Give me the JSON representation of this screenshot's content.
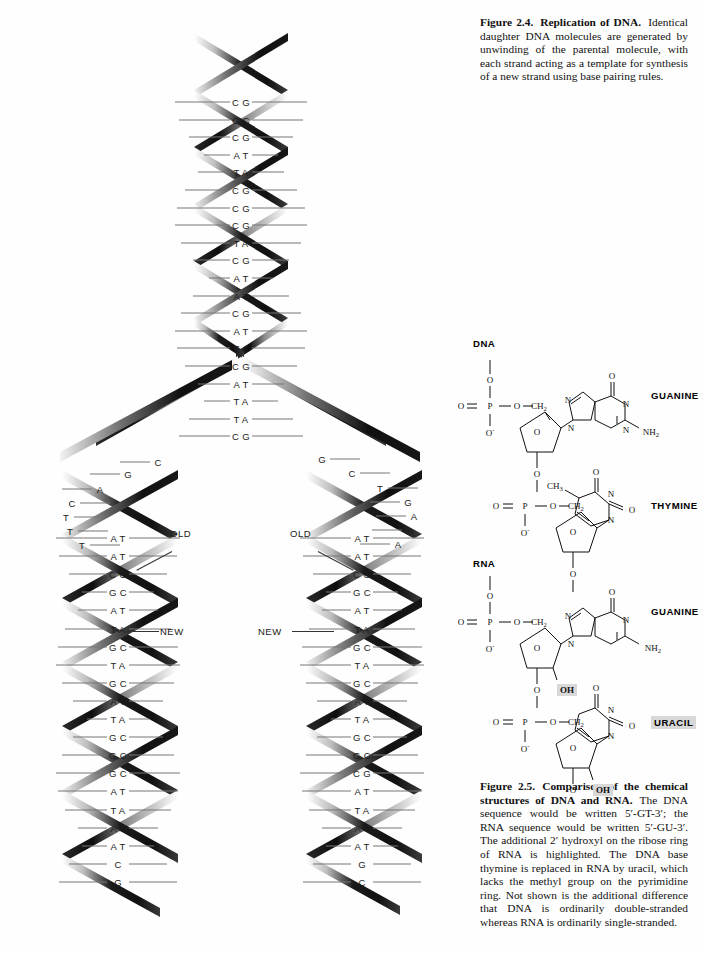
{
  "page": {
    "background": "#ffffff",
    "width": 702,
    "height": 953
  },
  "figure_2_4": {
    "label": "Figure 2.4.",
    "title": "Replication of DNA.",
    "body": "Identical daughter DNA molecules are generated by unwinding of the parental molecule, with each strand acting as a template for synthesis of a new strand using base pairing rules.",
    "annotations": {
      "old_left": "OLD",
      "new_left": "NEW",
      "old_right": "OLD",
      "new_right": "NEW"
    },
    "parent_helix_pairs": [
      "CG",
      "GC",
      "CG",
      "AT",
      "TA",
      "CG",
      "CG",
      "CG",
      "TA",
      "CG",
      "AT",
      "AT",
      "CG",
      "AT",
      "TA",
      "CG",
      "AT",
      "TA",
      "TA",
      "CG"
    ],
    "fork_left_single_bases": [
      "C",
      "G",
      "A",
      "C",
      "T",
      "T",
      "T"
    ],
    "fork_right_single_bases": [
      "G",
      "C",
      "T",
      "G",
      "A",
      "A",
      "A"
    ],
    "daughter_left_pairs": [
      "AT",
      "AT",
      "CG",
      "GC",
      "AT",
      "TA",
      "GC",
      "TA",
      "GC",
      "AT",
      "TA",
      "GC",
      "GC",
      "GC",
      "AT",
      "TA",
      "AT",
      "AT",
      "C",
      "G"
    ],
    "daughter_right_pairs": [
      "AT",
      "AT",
      "CG",
      "GC",
      "AT",
      "TA",
      "GC",
      "TA",
      "GC",
      "AT",
      "TA",
      "GC",
      "GC",
      "CG",
      "AT",
      "TA",
      "AT",
      "AT",
      "G",
      "C"
    ]
  },
  "figure_2_5": {
    "label": "Figure 2.5.",
    "title": "Comparison of the chemical structures of DNA and RNA.",
    "body": "The DNA sequence would be written 5′-GT-3′; the RNA sequence would be written 5′-GU-3′. The additional 2′ hydroxyl on the ribose ring of RNA is highlighted. The DNA base thymine is replaced in RNA by uracil, which lacks the methyl group on the pyrimidine ring. Not shown is the additional difference that DNA is ordinarily double-stranded whereas RNA is ordinarily single-stranded.",
    "dna": {
      "heading": "DNA",
      "base_1": "GUANINE",
      "base_2": "THYMINE",
      "atoms": [
        "O",
        "O",
        "P",
        "O",
        "O",
        "CH2",
        "O",
        "N",
        "N",
        "N",
        "N",
        "NH2",
        "O",
        "O",
        "P",
        "O",
        "O",
        "CH2",
        "O",
        "N",
        "N",
        "CH3",
        "O",
        "O",
        "O"
      ],
      "methyl_label": "CH3"
    },
    "rna": {
      "heading": "RNA",
      "base_1": "GUANINE",
      "base_2": "URACIL",
      "hydroxyl_1": "OH",
      "hydroxyl_2": "OH",
      "atoms": [
        "O",
        "O",
        "P",
        "O",
        "O",
        "CH2",
        "O",
        "N",
        "N",
        "N",
        "NH2",
        "O",
        "O",
        "P",
        "O",
        "O",
        "CH2",
        "O",
        "N",
        "N",
        "O",
        "O"
      ],
      "highlight_color": "#d8d8d8"
    }
  }
}
